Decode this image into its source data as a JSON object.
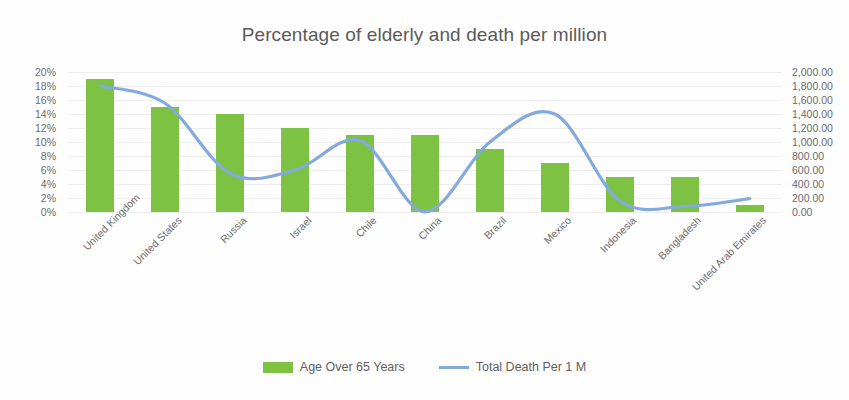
{
  "chart_data": {
    "type": "bar",
    "title": "Percentage of elderly and death per million",
    "xlabel": "",
    "ylabel": "",
    "grid": true,
    "legend_position": "bottom",
    "categories": [
      "United Kingdom",
      "United States",
      "Russia",
      "Israel",
      "Chile",
      "China",
      "Brazil",
      "Mexico",
      "Indonesia",
      "Bangladesh",
      "United Arab Emirates"
    ],
    "axes": {
      "left": {
        "name": "Percentage of population over 65",
        "min": 0,
        "max": 20,
        "step": 2,
        "format": "percent",
        "tick_labels": [
          "20%",
          "18%",
          "16%",
          "14%",
          "12%",
          "10%",
          "8%",
          "6%",
          "4%",
          "2%",
          "0%"
        ],
        "tick_values": [
          20,
          18,
          16,
          14,
          12,
          10,
          8,
          6,
          4,
          2,
          0
        ]
      },
      "right": {
        "name": "Total death per 1 million",
        "min": 0,
        "max": 2000,
        "step": 200,
        "tick_labels": [
          "2,000.00",
          "1,800.00",
          "1,600.00",
          "1,400.00",
          "1,200.00",
          "1,000.00",
          "800.00",
          "600.00",
          "400.00",
          "200.00",
          "0.00"
        ],
        "tick_values": [
          2000,
          1800,
          1600,
          1400,
          1200,
          1000,
          800,
          600,
          400,
          200,
          0
        ]
      }
    },
    "series": [
      {
        "name": "Age Over 65 Years",
        "type": "bar",
        "axis": "left",
        "color": "#7dc242",
        "values": [
          19.0,
          15.0,
          14.0,
          12.0,
          11.0,
          11.0,
          9.0,
          7.0,
          5.0,
          5.0,
          1.0
        ]
      },
      {
        "name": "Total Death Per 1 M",
        "type": "line",
        "axis": "right",
        "color": "#84a9dc",
        "values": [
          1800,
          1550,
          550,
          600,
          1020,
          3,
          1000,
          1400,
          160,
          80,
          190
        ]
      }
    ]
  },
  "legend": {
    "items": [
      {
        "label": "Age Over 65 Years",
        "marker": "bar-swatch",
        "color": "#7dc242"
      },
      {
        "label": "Total Death Per 1 M",
        "marker": "line-swatch",
        "color": "#84a9dc"
      }
    ]
  }
}
